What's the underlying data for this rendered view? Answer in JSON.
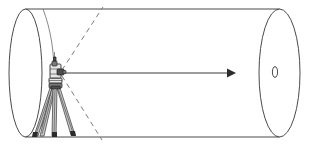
{
  "figure": {
    "title": "Surveying instrument on tripod sighting through a cylindrical tunnel",
    "type": "technical-line-drawing",
    "background_color": "#ffffff",
    "width": 312,
    "height": 147
  },
  "colors": {
    "outline": "#4a4a4a",
    "thin_outline": "#6b6b6b",
    "dashed": "#7d7d7d",
    "sight_line": "#3a3a3a",
    "arrowhead": "#2c2c2c",
    "instrument_light": "#e6e6e6",
    "instrument_mid": "#7a7a7a",
    "instrument_dark": "#4d4d4d",
    "leg_fill": "#c9c9c9",
    "foot": "#2b2b2b"
  },
  "elements": {
    "cylinder": {
      "name": "cylinder",
      "description": "Large horizontal cylinder drawn in perspective",
      "near_end_ellipse": {
        "cx": 25.5,
        "cy": 73,
        "rx": 16.5,
        "ry": 64
      },
      "far_end_ellipse": {
        "cx": 279.5,
        "cy": 73,
        "rx": 20.5,
        "ry": 64
      },
      "top_edge": {
        "x1": 25.5,
        "y1": 9,
        "x2": 279.5,
        "y2": 9
      },
      "bottom_edge": {
        "x1": 25.5,
        "y1": 137,
        "x2": 279.5,
        "y2": 137
      }
    },
    "target_hole": {
      "name": "target-hole",
      "description": "Small ellipse marking the target at the far end of the cylinder",
      "cx": 275,
      "cy": 72,
      "rx": 2.6,
      "ry": 5.4
    },
    "sight_line": {
      "name": "sight-line",
      "description": "Solid horizontal line of sight from instrument to target with arrowhead",
      "x1": 64,
      "y1": 73,
      "x2": 236,
      "y2": 73,
      "arrow_tip_x": 236,
      "arrow_half_height": 4.5,
      "arrow_length": 9
    },
    "cone_upper": {
      "name": "field-of-view-upper",
      "description": "Dashed line from instrument rising to the upper right",
      "x1": 62,
      "y1": 70,
      "x2": 103,
      "y2": 7
    },
    "cone_lower": {
      "name": "field-of-view-lower",
      "description": "Dashed line from instrument descending to the lower right",
      "x1": 62,
      "y1": 76,
      "x2": 102,
      "y2": 140
    },
    "interior_arc": {
      "name": "interior-arc",
      "description": "Faint curved section line running through the instrument position inside the cylinder",
      "top_point": {
        "x": 43,
        "y": 9
      },
      "mid_point": {
        "x": 54,
        "y": 73
      },
      "bottom_point": {
        "x": 36,
        "y": 136
      }
    },
    "instrument": {
      "name": "total-station",
      "description": "Optical surveying instrument (total station / theodolite) mounted on tripod",
      "head_center": {
        "x": 56,
        "y": 72
      },
      "telescope_tip": {
        "x": 66,
        "y": 73
      }
    },
    "tripod": {
      "name": "tripod",
      "description": "Three-legged tripod supporting the instrument",
      "apex": {
        "x": 55,
        "y": 86
      },
      "feet": [
        {
          "x": 34,
          "y": 136
        },
        {
          "x": 54,
          "y": 136
        },
        {
          "x": 73,
          "y": 135
        }
      ]
    }
  },
  "annotations": {
    "figure_caption": "",
    "labels": []
  }
}
